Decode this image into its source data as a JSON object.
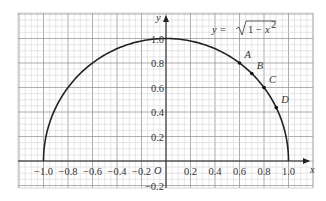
{
  "chart_data": {
    "type": "line",
    "title": "",
    "equation_label": "y = √(1 − x²)",
    "xlabel": "x",
    "ylabel": "y",
    "origin_label": "O",
    "xlim": [
      -1.2,
      1.2
    ],
    "ylim": [
      -0.2,
      1.2
    ],
    "grid": true,
    "x_ticks": [
      "−1.0",
      "−0.8",
      "−0.6",
      "−0.4",
      "−0.2",
      "0.2",
      "0.4",
      "0.6",
      "0.8",
      "1.0"
    ],
    "x_tick_values": [
      -1.0,
      -0.8,
      -0.6,
      -0.4,
      -0.2,
      0.2,
      0.4,
      0.6,
      0.8,
      1.0
    ],
    "y_ticks": [
      "1.0",
      "0.8",
      "0.6",
      "0.4",
      "0.2",
      "−0.2"
    ],
    "y_tick_values": [
      1.0,
      0.8,
      0.6,
      0.4,
      0.2,
      -0.2
    ],
    "series": [
      {
        "name": "y = sqrt(1 - x^2)",
        "x_range": [
          -1,
          1
        ]
      }
    ],
    "points": [
      {
        "label": "A",
        "x": 0.6,
        "y": 0.8
      },
      {
        "label": "B",
        "x": 0.7,
        "y": 0.714
      },
      {
        "label": "C",
        "x": 0.8,
        "y": 0.6
      },
      {
        "label": "D",
        "x": 0.9,
        "y": 0.436
      }
    ]
  }
}
